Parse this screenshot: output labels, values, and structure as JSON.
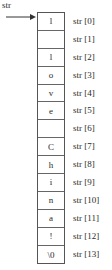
{
  "diagram": {
    "pointer_label": "str",
    "cells": [
      "l",
      "",
      "l",
      "o",
      "v",
      "e",
      "",
      "C",
      "h",
      "i",
      "n",
      "a",
      "!",
      "\\0"
    ],
    "index_labels": [
      "str [0]",
      "str [1]",
      "str [2]",
      "str [3]",
      "str [4]",
      "str [5]",
      "str [6]",
      "str [7]",
      "str [8]",
      "str [9]",
      "str [10]",
      "str [11]",
      "str [12]",
      "str [13]"
    ]
  }
}
